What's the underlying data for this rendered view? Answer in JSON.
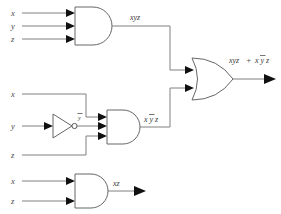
{
  "diagram": {
    "background_color": "#ffffff",
    "wire_color": "#808080",
    "gate_outline_color": "#666666",
    "label_color": "#3a3a3a",
    "arrow_color": "#111111"
  },
  "gates": {
    "and_top": {
      "name": "AND",
      "inputs": [
        "x",
        "y",
        "z"
      ],
      "output_label": "xyz"
    },
    "not_mid": {
      "name": "NOT",
      "input": "y",
      "output_label": "y"
    },
    "and_mid": {
      "name": "AND",
      "inputs": [
        "x",
        "y",
        "z"
      ],
      "output_label": "xyz"
    },
    "or_out": {
      "name": "OR",
      "inputs": [
        "xyz",
        "xyz"
      ],
      "output_label": "xyz + xyz"
    },
    "and_bottom": {
      "name": "AND",
      "inputs": [
        "x",
        "z"
      ],
      "output_label": "xz"
    }
  },
  "inputs": {
    "top": [
      {
        "label": "x"
      },
      {
        "label": "y"
      },
      {
        "label": "z"
      }
    ],
    "middle": [
      {
        "label": "x"
      },
      {
        "label": "y"
      },
      {
        "label": "z"
      }
    ],
    "bottom": [
      {
        "label": "x"
      },
      {
        "label": "z"
      }
    ]
  },
  "labels": {
    "top_and_output": "xyz",
    "not_output_base": "y",
    "mid_and_output_x": "x",
    "mid_and_output_y": "y",
    "mid_and_output_z": "z",
    "or_output_term1": "xyz",
    "or_output_plus": "+",
    "or_output_term2_x": "x",
    "or_output_term2_y": "y",
    "or_output_term2_z": "z",
    "bottom_and_output": "xz"
  }
}
